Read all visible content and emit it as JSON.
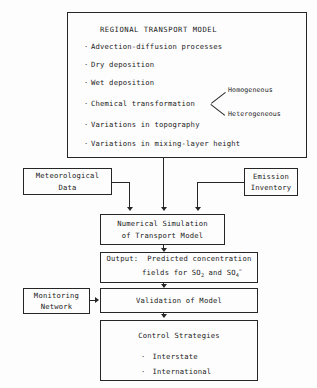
{
  "diagram": {
    "model_box": {
      "heading": "REGIONAL TRANSPORT MODEL",
      "bullets": [
        "Advection-diffusion processes",
        "Dry deposition",
        "Wet deposition",
        "Chemical transformation",
        "Variations in topography",
        "Variations in mixing-layer height"
      ],
      "branch_labels": [
        "Homogeneous",
        "Heterogeneous"
      ],
      "bullet_marker": "·"
    },
    "meteorological": {
      "line1": "Meteorological",
      "line2": "Data"
    },
    "emission": {
      "line1": "Emission",
      "line2": "Inventory"
    },
    "simulation": {
      "line1": "Numerical Simulation",
      "line2": "of Transport Model"
    },
    "output": {
      "line1_prefix": "Output:",
      "line1_rest": "Predicted concentration",
      "line2_prefix": "fields for",
      "species1_base": "SO",
      "species1_sub": "2",
      "conjunction": "and",
      "species2_base": "SO",
      "species2_sub": "4",
      "species2_sup": "="
    },
    "monitoring": {
      "line1": "Monitoring",
      "line2": "Network"
    },
    "validation": {
      "label": "Validation of Model"
    },
    "control": {
      "heading": "Control Strategies",
      "bullets": [
        "Interstate",
        "International"
      ],
      "bullet_marker": "·"
    },
    "colors": {
      "line": "#262626",
      "background": "#fdfdfd",
      "text": "#1a1a1a"
    }
  }
}
